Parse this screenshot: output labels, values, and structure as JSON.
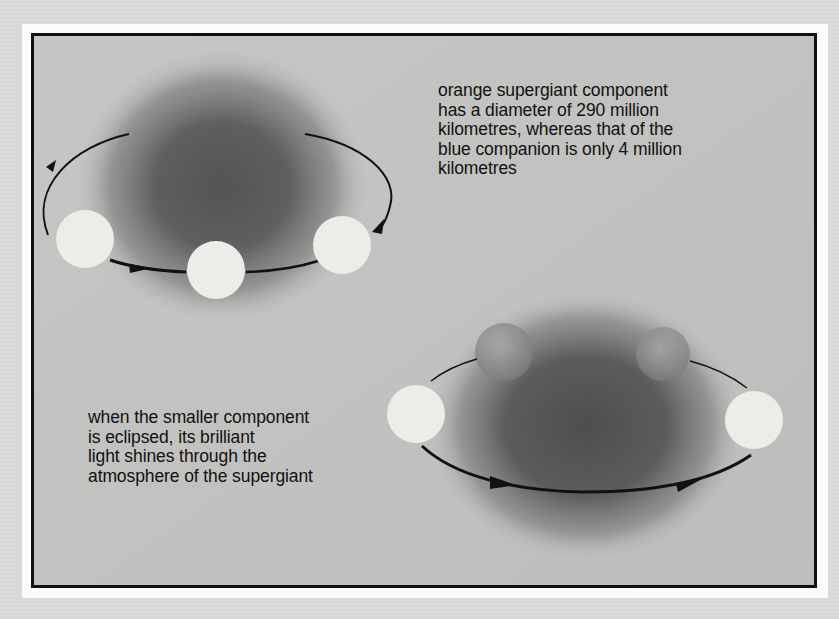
{
  "diagram": {
    "captions": {
      "top": {
        "lines": [
          "orange supergiant component",
          "has a diameter of 290 million",
          "kilometres, whereas that of the",
          "blue companion is only 4 million",
          "kilometres"
        ]
      },
      "bottom": {
        "lines": [
          "when the smaller component",
          "is eclipsed, its brilliant",
          "light shines through the",
          "atmosphere of the supergiant"
        ]
      }
    },
    "panels": [
      {
        "name": "orbit-upper-left",
        "supergiant": "dark diffuse glow centered behind orbit",
        "companion_positions": [
          "left",
          "front-center",
          "right"
        ],
        "direction_arrows": 3
      },
      {
        "name": "orbit-lower-right",
        "supergiant": "dark diffuse glow, companion partly eclipsed behind",
        "companion_positions": [
          "left",
          "behind-left (eclipsed)",
          "behind-right (eclipsed)",
          "right"
        ],
        "direction_arrows": 2
      }
    ],
    "colors": {
      "frame_border": "#111111",
      "panel_background": "#c4c4c2",
      "mat": "#fbfbfb",
      "supergiant_core": "#555555",
      "companion": "#ececea"
    }
  }
}
